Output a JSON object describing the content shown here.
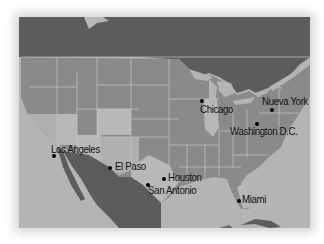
{
  "map": {
    "colors": {
      "background": "#ffffff",
      "ocean": "#b4b4b4",
      "foreign_land": "#5c5c5c",
      "us_states": "#8a8a8a",
      "highlighted_states": "#b8b8b8",
      "borders": "#c8c8c8",
      "city_dot": "#000000"
    },
    "cities": [
      {
        "name": "Chicago",
        "dot": [
          202,
          101
        ],
        "label": [
          200,
          104
        ]
      },
      {
        "name": "Nueva York",
        "dot": [
          272,
          110
        ],
        "label": [
          262,
          97
        ]
      },
      {
        "name": "Washington D.C.",
        "dot": [
          257,
          124
        ],
        "label": [
          230,
          127
        ]
      },
      {
        "name": "Los Angeles",
        "dot": [
          54,
          156
        ],
        "label": [
          51,
          145
        ]
      },
      {
        "name": "El Paso",
        "dot": [
          110,
          168
        ],
        "label": [
          115,
          162
        ]
      },
      {
        "name": "Houston",
        "dot": [
          164,
          179
        ],
        "label": [
          168,
          173
        ]
      },
      {
        "name": "San Antonio",
        "dot": [
          148,
          185
        ],
        "label": [
          148,
          186
        ]
      },
      {
        "name": "Miami",
        "dot": [
          239,
          201
        ],
        "label": [
          242,
          195
        ]
      }
    ]
  }
}
